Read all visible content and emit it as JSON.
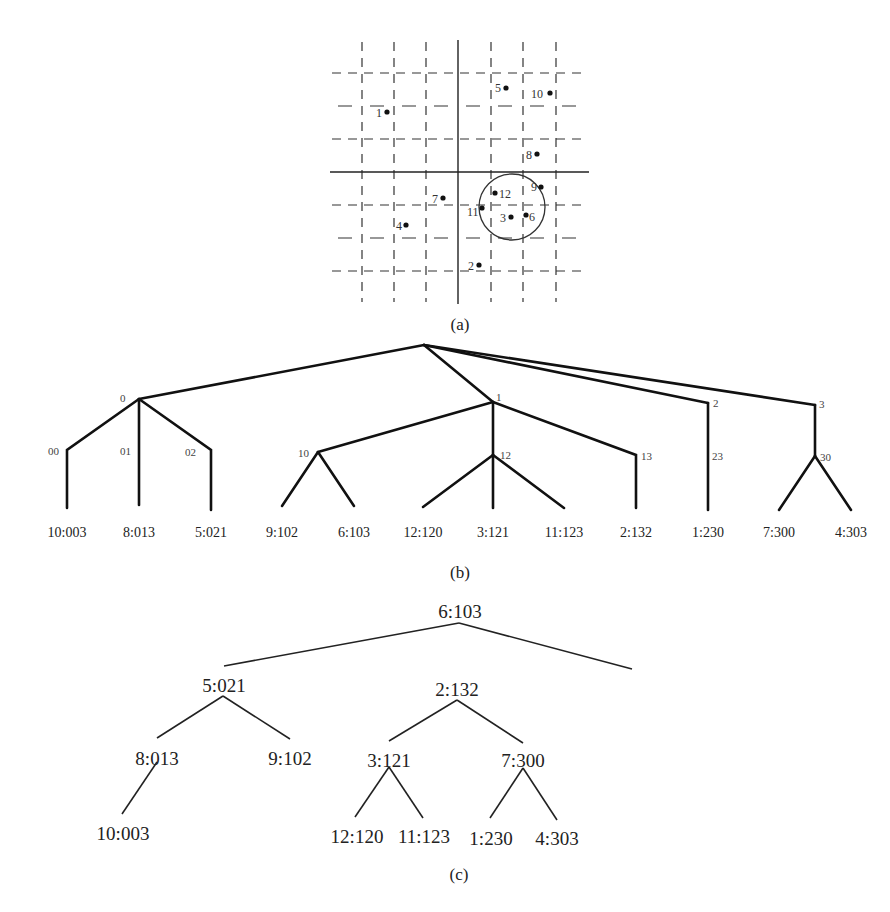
{
  "figure": {
    "panels": [
      {
        "id": "a",
        "caption": "(a)"
      },
      {
        "id": "b",
        "caption": "(b)"
      },
      {
        "id": "c",
        "caption": "(c)"
      }
    ]
  },
  "panel_a": {
    "caption": "(a)",
    "points": [
      {
        "label": "1",
        "x": 387,
        "y": 112
      },
      {
        "label": "2",
        "x": 479,
        "y": 265
      },
      {
        "label": "3",
        "x": 511,
        "y": 217
      },
      {
        "label": "4",
        "x": 406,
        "y": 225
      },
      {
        "label": "5",
        "x": 506,
        "y": 88
      },
      {
        "label": "6",
        "x": 526,
        "y": 215
      },
      {
        "label": "7",
        "x": 443,
        "y": 198
      },
      {
        "label": "8",
        "x": 537,
        "y": 154
      },
      {
        "label": "9",
        "x": 541,
        "y": 187
      },
      {
        "label": "10",
        "x": 550,
        "y": 93
      },
      {
        "label": "11",
        "x": 482,
        "y": 208
      },
      {
        "label": "12",
        "x": 495,
        "y": 193
      }
    ],
    "query_circle": {
      "cx": 512,
      "cy": 207,
      "r": 33
    }
  },
  "panel_b": {
    "caption": "(b)",
    "internal_nodes": [
      "0",
      "1",
      "2",
      "3",
      "00",
      "01",
      "02",
      "10",
      "12",
      "13",
      "23",
      "30"
    ],
    "leaves": [
      "10:003",
      "8:013",
      "5:021",
      "9:102",
      "6:103",
      "12:120",
      "3:121",
      "11:123",
      "2:132",
      "1:230",
      "7:300",
      "4:303"
    ]
  },
  "panel_c": {
    "caption": "(c)",
    "root": "6:103",
    "level1": [
      "5:021",
      "2:132"
    ],
    "level2": [
      "8:013",
      "9:102",
      "3:121",
      "7:300"
    ],
    "level3": [
      "10:003",
      "12:120",
      "11:123",
      "1:230",
      "4:303"
    ]
  }
}
